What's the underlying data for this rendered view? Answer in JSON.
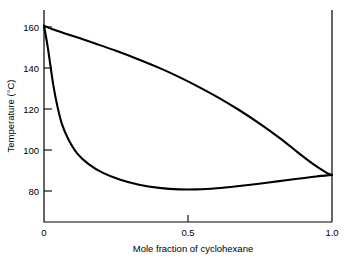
{
  "chart_data": {
    "type": "line",
    "title": "",
    "xlabel": "Mole fraction of cyclohexane",
    "ylabel": "Temperature (°C)",
    "xlim": [
      0,
      1.0
    ],
    "ylim": [
      60,
      168
    ],
    "grid": false,
    "legend": "none",
    "xticks": [
      {
        "value": 0,
        "label": "0"
      },
      {
        "value": 0.5,
        "label": "0.5"
      },
      {
        "value": 1.0,
        "label": "1.0"
      }
    ],
    "yticks": [
      {
        "value": 80,
        "label": "80"
      },
      {
        "value": 100,
        "label": "100"
      },
      {
        "value": 120,
        "label": "120"
      },
      {
        "value": 140,
        "label": "140"
      },
      {
        "value": 160,
        "label": "160"
      }
    ],
    "annotations": [],
    "series": [
      {
        "name": "vapour-curve",
        "points": [
          [
            0.0,
            160.0
          ],
          [
            0.03,
            158.2
          ],
          [
            0.07,
            156.2
          ],
          [
            0.12,
            153.8
          ],
          [
            0.18,
            150.8
          ],
          [
            0.25,
            147.2
          ],
          [
            0.32,
            143.3
          ],
          [
            0.4,
            138.5
          ],
          [
            0.47,
            133.8
          ],
          [
            0.54,
            128.6
          ],
          [
            0.61,
            123.0
          ],
          [
            0.68,
            116.8
          ],
          [
            0.75,
            110.0
          ],
          [
            0.82,
            102.6
          ],
          [
            0.88,
            95.6
          ],
          [
            0.93,
            90.0
          ],
          [
            0.965,
            86.6
          ],
          [
            0.985,
            84.8
          ],
          [
            1.0,
            84.0
          ]
        ]
      },
      {
        "name": "liquid-curve",
        "points": [
          [
            0.0,
            160.0
          ],
          [
            0.012,
            150.0
          ],
          [
            0.022,
            140.0
          ],
          [
            0.032,
            130.0
          ],
          [
            0.045,
            120.0
          ],
          [
            0.062,
            110.0
          ],
          [
            0.085,
            102.0
          ],
          [
            0.115,
            95.0
          ],
          [
            0.155,
            89.5
          ],
          [
            0.205,
            85.0
          ],
          [
            0.265,
            81.5
          ],
          [
            0.33,
            79.0
          ],
          [
            0.4,
            77.4
          ],
          [
            0.47,
            76.6
          ],
          [
            0.53,
            76.6
          ],
          [
            0.6,
            77.2
          ],
          [
            0.67,
            78.2
          ],
          [
            0.74,
            79.4
          ],
          [
            0.81,
            80.7
          ],
          [
            0.88,
            82.0
          ],
          [
            0.945,
            83.2
          ],
          [
            1.0,
            84.0
          ]
        ]
      }
    ]
  }
}
